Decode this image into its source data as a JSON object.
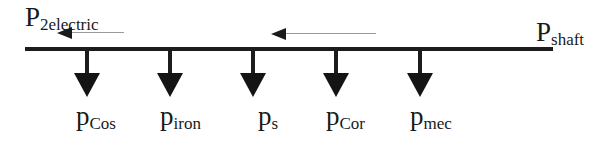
{
  "diagram": {
    "input": {
      "symbol": "P",
      "subscript": "shaft"
    },
    "output": {
      "symbol": "P",
      "subscript": "2electric"
    },
    "flow_direction": "right-to-left",
    "losses": [
      {
        "symbol": "p",
        "subscript": "Cos"
      },
      {
        "symbol": "p",
        "subscript": "iron"
      },
      {
        "symbol": "p",
        "subscript": "s"
      },
      {
        "symbol": "p",
        "subscript": "Cor"
      },
      {
        "symbol": "p",
        "subscript": "mec"
      }
    ],
    "colors": {
      "line": "#1c1c1c",
      "flow_arrow_line": "#9a9a9a",
      "background": "#ffffff"
    }
  }
}
